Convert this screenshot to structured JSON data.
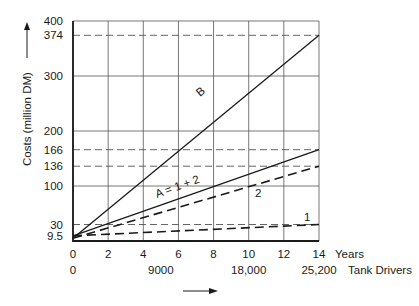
{
  "chart_data": {
    "type": "line",
    "title": "",
    "xlabel": "Years",
    "xlabel_secondary": "Tank Drivers",
    "ylabel": "Costs (million DM)",
    "xlim": [
      0,
      14
    ],
    "ylim": [
      0,
      400
    ],
    "grid": true,
    "x_ticks": [
      0,
      2,
      4,
      6,
      8,
      10,
      12,
      14
    ],
    "x_tick_labels": [
      "0",
      "2",
      "4",
      "6",
      "8",
      "10",
      "12",
      "14"
    ],
    "x_secondary_ticks": [
      {
        "x": 0,
        "label": "0"
      },
      {
        "x": 5,
        "label": "9000"
      },
      {
        "x": 10,
        "label": "18,000"
      },
      {
        "x": 14,
        "label": "25,200"
      }
    ],
    "y_grid": [
      0,
      100,
      200,
      300,
      400
    ],
    "y_tick_labels": [
      {
        "y": 400,
        "label": "400"
      },
      {
        "y": 374,
        "label": "374"
      },
      {
        "y": 300,
        "label": "300"
      },
      {
        "y": 200,
        "label": "200"
      },
      {
        "y": 166,
        "label": "166"
      },
      {
        "y": 136,
        "label": "136"
      },
      {
        "y": 100,
        "label": "100"
      },
      {
        "y": 30,
        "label": "30"
      },
      {
        "y": 9.5,
        "label": "9.5"
      }
    ],
    "reference_lines": [
      374,
      166,
      136,
      30
    ],
    "series": [
      {
        "name": "B",
        "style": "solid",
        "x": [
          0,
          14
        ],
        "values": [
          5,
          374
        ],
        "label_pos": {
          "x": 5.4,
          "y": 265
        }
      },
      {
        "name": "A = 1 + 2",
        "style": "solid",
        "x": [
          0,
          14
        ],
        "values": [
          9.5,
          166
        ],
        "label_pos": {
          "x": 2.5,
          "y": 86
        }
      },
      {
        "name": "2",
        "style": "dashed",
        "x": [
          0,
          14
        ],
        "values": [
          5,
          136
        ],
        "label_pos": {
          "x": 10.5,
          "y": 88
        }
      },
      {
        "name": "1",
        "style": "dashed",
        "x": [
          0,
          14
        ],
        "values": [
          9.5,
          30
        ],
        "label_pos": {
          "x": 13.3,
          "y": 36
        }
      }
    ],
    "legend": "inline labels"
  },
  "labels": {
    "y_axis": "Costs (million DM)",
    "x_axis_years": "Years",
    "x_axis_drivers": "Tank Drivers",
    "series_b": "B",
    "series_a": "A = 1 + 2",
    "series_2": "2",
    "series_1": "1"
  },
  "colors": {
    "ink": "#1a1a1a",
    "grid": "#555555",
    "background": "#ffffff"
  }
}
